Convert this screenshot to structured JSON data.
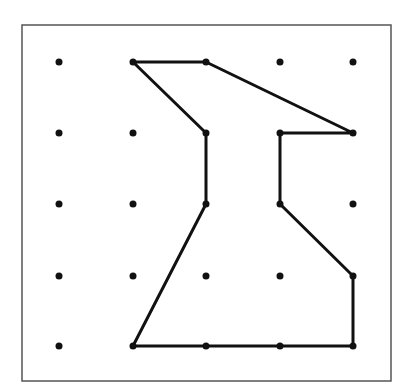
{
  "diagram": {
    "type": "geoboard-dot-grid-polygon",
    "frame": {
      "x": 22,
      "y": 25,
      "width": 369,
      "height": 356,
      "stroke": "#555555"
    },
    "grid": {
      "cols": 5,
      "rows": 5,
      "x_positions": [
        59,
        133,
        206,
        280,
        353
      ],
      "y_positions": [
        62,
        133,
        204,
        276,
        346
      ],
      "dot_radius": 3.5,
      "dot_color": "#111111"
    },
    "polygon": {
      "stroke": "#111111",
      "stroke_width": 3,
      "vertices_grid": [
        [
          1,
          0
        ],
        [
          2,
          0
        ],
        [
          4,
          1
        ],
        [
          3,
          1
        ],
        [
          3,
          2
        ],
        [
          4,
          3
        ],
        [
          4,
          4
        ],
        [
          3,
          4
        ],
        [
          2,
          4
        ],
        [
          1,
          4
        ],
        [
          2,
          2
        ],
        [
          2,
          1
        ]
      ],
      "closed": true
    }
  }
}
